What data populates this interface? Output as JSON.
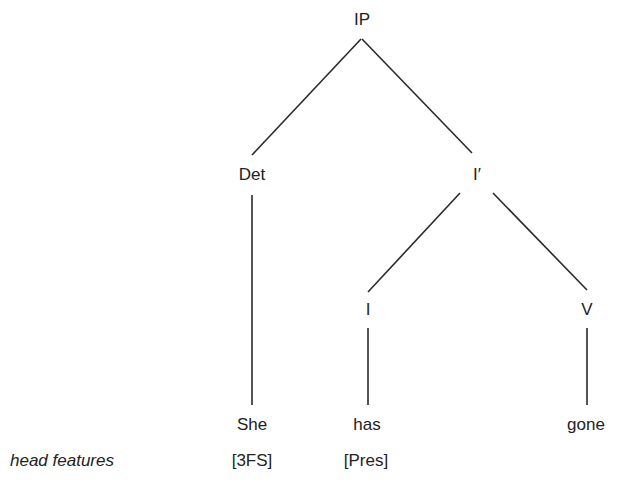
{
  "tree": {
    "root": "IP",
    "nodes": {
      "ip": "IP",
      "det": "Det",
      "ibar": "I′",
      "i": "I",
      "v": "V"
    },
    "words": {
      "she": "She",
      "has": "has",
      "gone": "gone"
    }
  },
  "features": {
    "label": "head features",
    "she": "[3FS]",
    "has": "[Pres]"
  },
  "colors": {
    "line": "#222222",
    "text": "#222222"
  }
}
